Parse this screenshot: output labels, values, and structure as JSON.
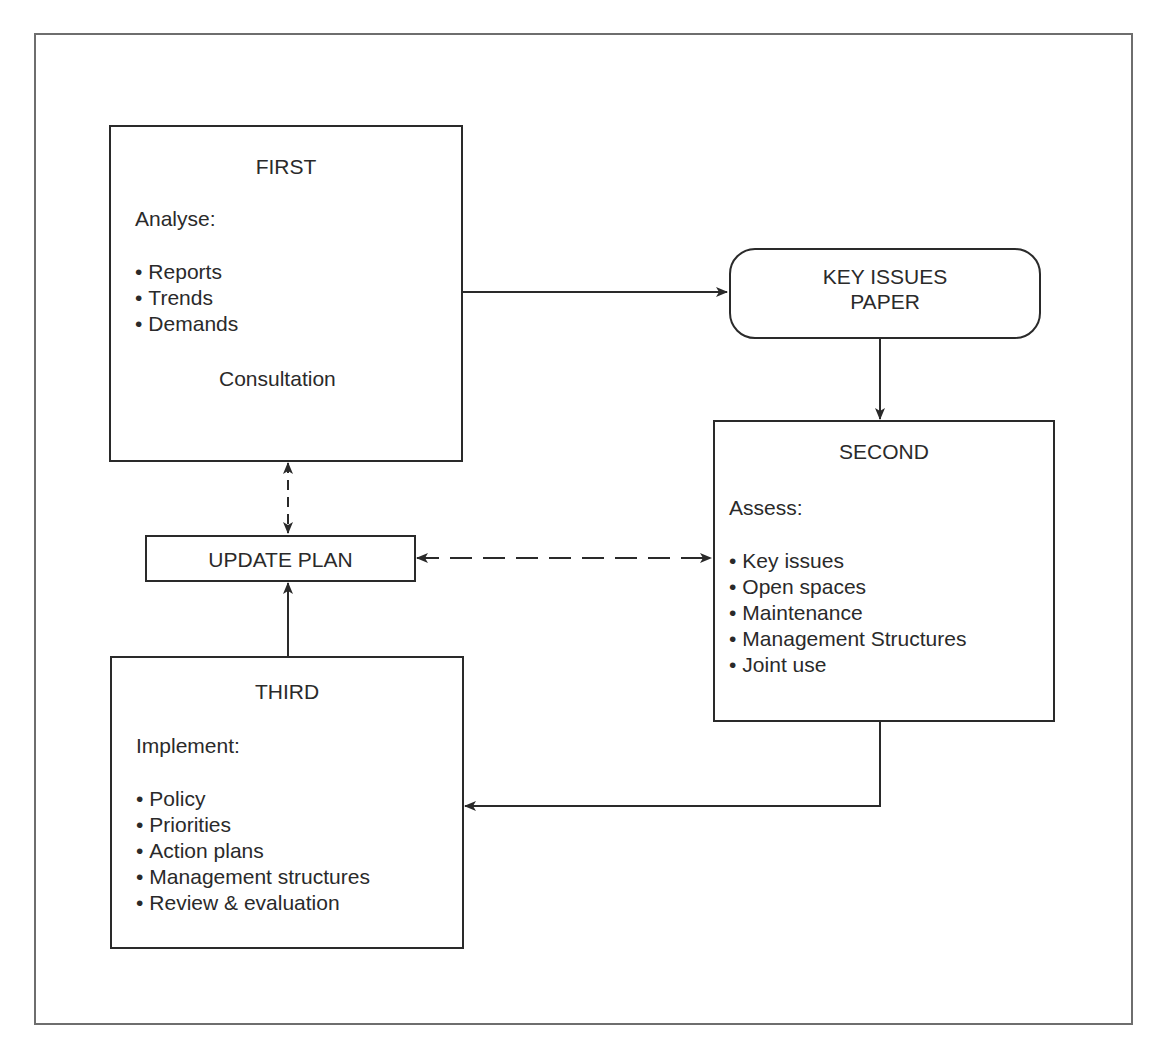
{
  "diagram": {
    "first": {
      "title": "FIRST",
      "heading": "Analyse:",
      "items": [
        "Reports",
        "Trends",
        "Demands"
      ],
      "footer": "Consultation"
    },
    "key_issues": {
      "line1": "KEY ISSUES",
      "line2": "PAPER"
    },
    "second": {
      "title": "SECOND",
      "heading": "Assess:",
      "items": [
        "Key issues",
        "Open spaces",
        "Maintenance",
        "Management Structures",
        "Joint use"
      ]
    },
    "update_plan": {
      "label": "UPDATE PLAN"
    },
    "third": {
      "title": "THIRD",
      "heading": "Implement:",
      "items": [
        "Policy",
        "Priorities",
        "Action plans",
        "Management structures",
        "Review & evaluation"
      ]
    },
    "connections": [
      {
        "from": "FIRST",
        "to": "KEY ISSUES PAPER",
        "style": "solid",
        "direction": "forward"
      },
      {
        "from": "KEY ISSUES PAPER",
        "to": "SECOND",
        "style": "solid",
        "direction": "forward"
      },
      {
        "from": "SECOND",
        "to": "THIRD",
        "style": "solid",
        "direction": "forward"
      },
      {
        "from": "THIRD",
        "to": "UPDATE PLAN",
        "style": "solid",
        "direction": "forward"
      },
      {
        "from": "UPDATE PLAN",
        "to": "FIRST",
        "style": "dashed",
        "direction": "both"
      },
      {
        "from": "UPDATE PLAN",
        "to": "SECOND",
        "style": "dashed",
        "direction": "both"
      }
    ],
    "colors": {
      "stroke": "#2a2a2a",
      "frame": "#6e6e6e",
      "background": "#ffffff"
    }
  }
}
